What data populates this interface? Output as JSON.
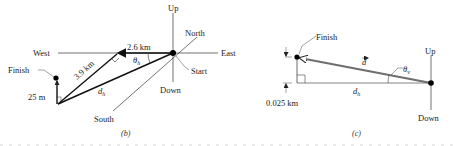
{
  "panel_b": {
    "caption": "(b)",
    "axes": {
      "up": "Up",
      "down": "Down",
      "north": "North",
      "south": "South",
      "east": "East",
      "west": "West"
    },
    "labels": {
      "start": "Start",
      "finish": "Finish",
      "leg1": "2.6 km",
      "leg2": "3.9 km",
      "leg3": "25 m",
      "dh": "d",
      "dh_sub": "h",
      "theta": "θ",
      "theta_sub": "h"
    }
  },
  "panel_c": {
    "caption": "(c)",
    "axes": {
      "up": "Up",
      "down": "Down"
    },
    "labels": {
      "finish": "Finish",
      "d_vec": "d",
      "theta": "θ",
      "theta_sub": "v",
      "dh": "d",
      "dh_sub": "h",
      "height": "0.025 km"
    }
  },
  "colors": {
    "line": "#222222",
    "vector_gray": "#6e6e6e",
    "thin": "#555555"
  }
}
